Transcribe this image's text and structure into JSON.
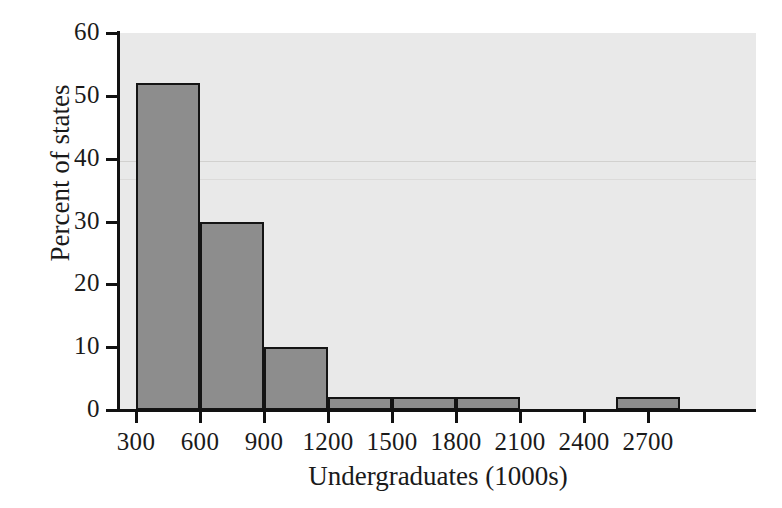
{
  "chart_data": {
    "type": "bar",
    "title": "",
    "subtitle": "",
    "xlabel": "Undergraduates (1000s)",
    "ylabel": "Percent of states",
    "xlim": [
      0,
      3000
    ],
    "ylim": [
      0,
      60
    ],
    "grid": false,
    "legend": "none",
    "bin_width": 300,
    "x_ticks": [
      300,
      600,
      900,
      1200,
      1500,
      1800,
      2100,
      2400,
      2700
    ],
    "x_tick_labels": [
      "300",
      "600",
      "900",
      "1200",
      "1500",
      "1800",
      "2100",
      "2400",
      "2700"
    ],
    "y_ticks": [
      0,
      10,
      20,
      30,
      40,
      50,
      60
    ],
    "y_tick_labels": [
      "0",
      "10",
      "20",
      "30",
      "40",
      "50",
      "60"
    ],
    "bins": [
      {
        "label": "300-600",
        "start": 300,
        "end": 600,
        "value": 52
      },
      {
        "label": "600-900",
        "start": 600,
        "end": 900,
        "value": 30
      },
      {
        "label": "900-1200",
        "start": 900,
        "end": 1200,
        "value": 10
      },
      {
        "label": "1200-1500",
        "start": 1200,
        "end": 1500,
        "value": 2
      },
      {
        "label": "1500-1800",
        "start": 1500,
        "end": 1800,
        "value": 2
      },
      {
        "label": "1800-2100",
        "start": 1800,
        "end": 2100,
        "value": 2
      },
      {
        "label": "2100-2400",
        "start": 2100,
        "end": 2400,
        "value": 0
      },
      {
        "label": "2400-2700",
        "start": 2400,
        "end": 2700,
        "value": 0
      },
      {
        "label": "2550-2850",
        "start": 2550,
        "end": 2850,
        "value": 2
      }
    ],
    "categories": [
      "300-600",
      "600-900",
      "900-1200",
      "1200-1500",
      "1500-1800",
      "1800-2100",
      "2100-2400",
      "2400-2700",
      "2550-2850"
    ],
    "values": [
      52,
      30,
      10,
      2,
      2,
      2,
      0,
      0,
      2
    ]
  },
  "colors": {
    "bar_fill": "#8d8d8d",
    "bar_stroke": "#141414",
    "plot_background": "#e9e9e9",
    "page_background": "#ffffff",
    "axis": "#121212",
    "text": "#1a1a1a"
  }
}
